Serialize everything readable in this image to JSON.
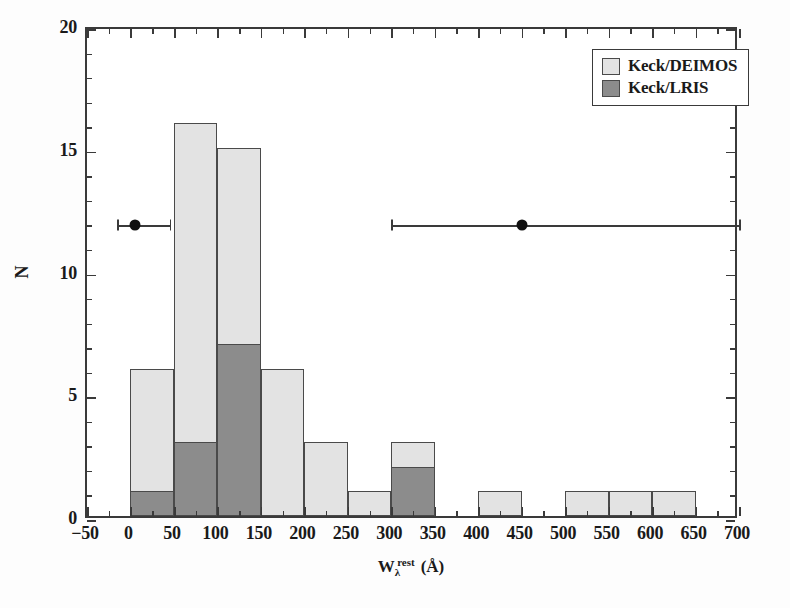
{
  "chart_data": {
    "type": "bar",
    "title": "",
    "subtitle": "",
    "xlabel_parts": {
      "base": "W",
      "subscript": "λ",
      "superscript": "rest",
      "unit": "(Å)"
    },
    "xlabel": "W_λ^rest (Å)",
    "ylabel": "N",
    "xlim": [
      -50,
      700
    ],
    "ylim": [
      0,
      20
    ],
    "xticks": [
      -50,
      0,
      50,
      100,
      150,
      200,
      250,
      300,
      350,
      400,
      450,
      500,
      550,
      600,
      650,
      700
    ],
    "xtick_labels": [
      "−50",
      "0",
      "50",
      "100",
      "150",
      "200",
      "250",
      "300",
      "350",
      "400",
      "450",
      "500",
      "550",
      "600",
      "650",
      "700"
    ],
    "yticks": [
      0,
      5,
      10,
      15,
      20
    ],
    "ytick_labels": [
      "0",
      "5",
      "10",
      "15",
      "20"
    ],
    "x_minor_step": 25,
    "y_minor_step": 1,
    "grid": false,
    "bin_width": 50,
    "bin_starts": [
      0,
      50,
      100,
      150,
      200,
      250,
      300,
      350,
      400,
      450,
      500,
      550,
      600,
      650
    ],
    "categories": [
      "0–50",
      "50–100",
      "100–150",
      "150–200",
      "200–250",
      "250–300",
      "300–350",
      "350–400",
      "400–450",
      "450–500",
      "500–550",
      "550–600",
      "600–650",
      "650–700"
    ],
    "stacked": true,
    "series": [
      {
        "name": "Keck/DEIMOS",
        "color": "#e3e3e3",
        "values": [
          6,
          16,
          15,
          6,
          3,
          1,
          3,
          0,
          1,
          0,
          1,
          1,
          1,
          0
        ],
        "note": "total stacked height of each bin"
      },
      {
        "name": "Keck/LRIS",
        "color": "#8c8c8c",
        "values": [
          1,
          3,
          7,
          0,
          0,
          0,
          2,
          0,
          0,
          0,
          0,
          0,
          0,
          0
        ],
        "note": "dark sub-population drawn from baseline"
      }
    ],
    "legend": {
      "position": "upper-right",
      "entries": [
        {
          "label": "Keck/DEIMOS",
          "color": "#e3e3e3"
        },
        {
          "label": "Keck/LRIS",
          "color": "#8c8c8c"
        }
      ]
    },
    "error_bars": [
      {
        "x": 5,
        "y": 12,
        "x_low": -15,
        "x_high": 45
      },
      {
        "x": 450,
        "y": 12,
        "x_low": 300,
        "x_high": 700
      }
    ]
  },
  "legend": {
    "entries": [
      {
        "label": "Keck/DEIMOS"
      },
      {
        "label": "Keck/LRIS"
      }
    ]
  },
  "axes": {
    "y_title": "N",
    "x_title_base": "W",
    "x_title_sub": "λ",
    "x_title_sup": "rest",
    "x_title_unit": "(Å)"
  }
}
